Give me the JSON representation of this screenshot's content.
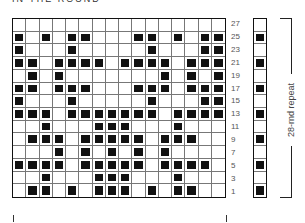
{
  "title": "IN THE ROUND",
  "chart": {
    "columns": 16,
    "row_labels": [
      "27",
      "25",
      "23",
      "21",
      "19",
      "17",
      "15",
      "13",
      "11",
      "9",
      "7",
      "5",
      "3",
      "1"
    ],
    "rows": [
      [],
      [
        1,
        3,
        5,
        6,
        10,
        11,
        13,
        15,
        16
      ],
      [
        1,
        5,
        11,
        15,
        16
      ],
      [
        1,
        2,
        4,
        5,
        6,
        7,
        9,
        10,
        11,
        12,
        14,
        15,
        16
      ],
      [
        2,
        4,
        12,
        14,
        16
      ],
      [
        1,
        2,
        4,
        5,
        6,
        10,
        11,
        12,
        14,
        15,
        16
      ],
      [
        1,
        5,
        11,
        15,
        16
      ],
      [
        1,
        2,
        3,
        5,
        6,
        7,
        8,
        9,
        10,
        11,
        13,
        14,
        15,
        16
      ],
      [
        3,
        7,
        8,
        9,
        13
      ],
      [
        2,
        3,
        4,
        6,
        7,
        8,
        9,
        10,
        12,
        13,
        14
      ],
      [
        4,
        6,
        8,
        10,
        12
      ],
      [
        1,
        2,
        3,
        4,
        6,
        7,
        8,
        9,
        10,
        12,
        13,
        14,
        15
      ],
      [
        3,
        7,
        8,
        9,
        13
      ],
      [
        2,
        3,
        5,
        7,
        8,
        9,
        11,
        13,
        14
      ]
    ],
    "repeat_column": [
      0,
      1,
      0,
      1,
      0,
      1,
      0,
      1,
      0,
      1,
      0,
      1,
      0,
      1
    ]
  },
  "repeat_label": "28-rnd repeat",
  "colors": {
    "filled": "#111111",
    "empty": "#ffffff",
    "grid": "#777777"
  }
}
